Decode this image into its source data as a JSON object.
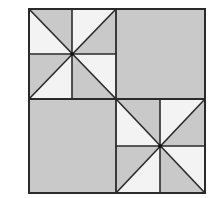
{
  "diagram": {
    "colors": {
      "shaded": "#c9c9c9",
      "light": "#f3f3f3",
      "line": "#2a2a2a",
      "background": "#ffffff"
    },
    "quadrants": [
      {
        "position": "top-left",
        "type": "pinwheel"
      },
      {
        "position": "top-right",
        "type": "solid-shaded"
      },
      {
        "position": "bottom-left",
        "type": "solid-shaded"
      },
      {
        "position": "bottom-right",
        "type": "pinwheel"
      }
    ]
  }
}
